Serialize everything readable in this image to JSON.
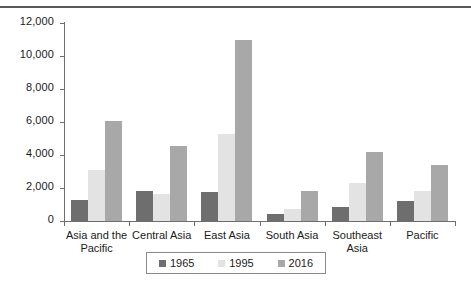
{
  "chart_data": {
    "type": "bar",
    "title": "",
    "subtitle": "",
    "xlabel": "",
    "ylabel": "",
    "ylim": [
      0,
      12000
    ],
    "ytick_labels": [
      "12,000",
      "10,000",
      "8,000",
      "6,000",
      "4,000",
      "2,000",
      "0"
    ],
    "ytick_values": [
      12000,
      10000,
      8000,
      6000,
      4000,
      2000,
      0
    ],
    "grid": false,
    "legend_position": "bottom",
    "categories": [
      "Asia and the\nPacific",
      "Central Asia",
      "East Asia",
      "South Asia",
      "Southeast Asia",
      "Pacific"
    ],
    "series": [
      {
        "name": "1965",
        "color": "#6e6e6e",
        "values": [
          1250,
          1800,
          1750,
          400,
          850,
          1200
        ]
      },
      {
        "name": "1995",
        "color": "#e3e3e3",
        "values": [
          3100,
          1650,
          5300,
          700,
          2300,
          1800
        ]
      },
      {
        "name": "2016",
        "color": "#a8a8a8",
        "values": [
          6050,
          4550,
          11000,
          1800,
          4200,
          3400
        ]
      }
    ]
  },
  "axis": {
    "axis_color": "#6e6e6e"
  },
  "decor": {
    "top_rule_color": "#5a5a5a"
  }
}
